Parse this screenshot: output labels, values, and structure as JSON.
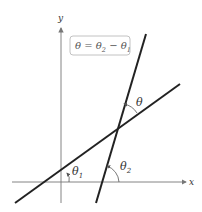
{
  "diagram": {
    "type": "angle between two lines",
    "axes": {
      "x_label": "x",
      "y_label": "y"
    },
    "formula": {
      "lhs": "θ",
      "eq": " = ",
      "t2": "θ",
      "s2": "2",
      "minus": " − ",
      "t1": "θ",
      "s1": "1"
    },
    "angle_labels": {
      "theta": "θ",
      "theta1": "θ",
      "theta1_sub": "1",
      "theta2": "θ",
      "theta2_sub": "2"
    },
    "colors": {
      "line": "#222222",
      "axis": "#777777",
      "box_border": "#bbbbbb"
    }
  }
}
